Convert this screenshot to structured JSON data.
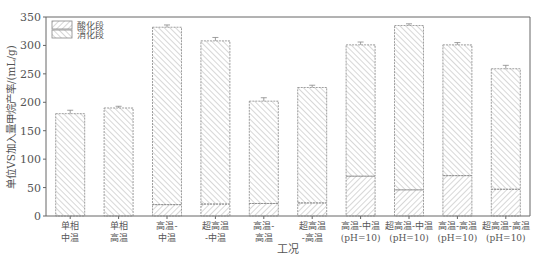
{
  "chart_data": {
    "type": "bar",
    "stacked": true,
    "title": "",
    "xlabel": "工况",
    "ylabel": "单位VS加入量甲烷产率/(mL/g)",
    "ylim": [
      0,
      350
    ],
    "yticks": [
      0,
      50,
      100,
      150,
      200,
      250,
      300,
      350
    ],
    "grid": false,
    "legend_position": "top-left inside",
    "categories": [
      [
        "单相",
        "中温"
      ],
      [
        "单相",
        "高温"
      ],
      [
        "高温-",
        "中温"
      ],
      [
        "超高温",
        "-中温"
      ],
      [
        "高温-",
        "高温"
      ],
      [
        "超高温",
        "-高温"
      ],
      [
        "高温-中温",
        "(pH=10)"
      ],
      [
        "超高温-中温",
        "(pH=10)"
      ],
      [
        "高温-高温",
        "(pH=10)"
      ],
      [
        "超高温-高温",
        "(pH=10)"
      ]
    ],
    "series": [
      {
        "name": "酸化段",
        "pattern": "forward-hatch",
        "values": [
          0,
          0,
          20,
          21,
          22,
          23,
          70,
          46,
          71,
          47
        ]
      },
      {
        "name": "消化段",
        "pattern": "back-hatch",
        "values": [
          180,
          190,
          312,
          287,
          180,
          203,
          231,
          289,
          230,
          212
        ]
      }
    ],
    "totals": [
      180,
      190,
      332,
      308,
      202,
      226,
      301,
      335,
      301,
      259
    ],
    "error_bars": [
      6,
      3,
      4,
      6,
      6,
      4,
      5,
      3,
      4,
      6
    ]
  },
  "colors": {
    "axis": "#666666",
    "bar_stroke": "#888888",
    "hatch": "#999999"
  }
}
